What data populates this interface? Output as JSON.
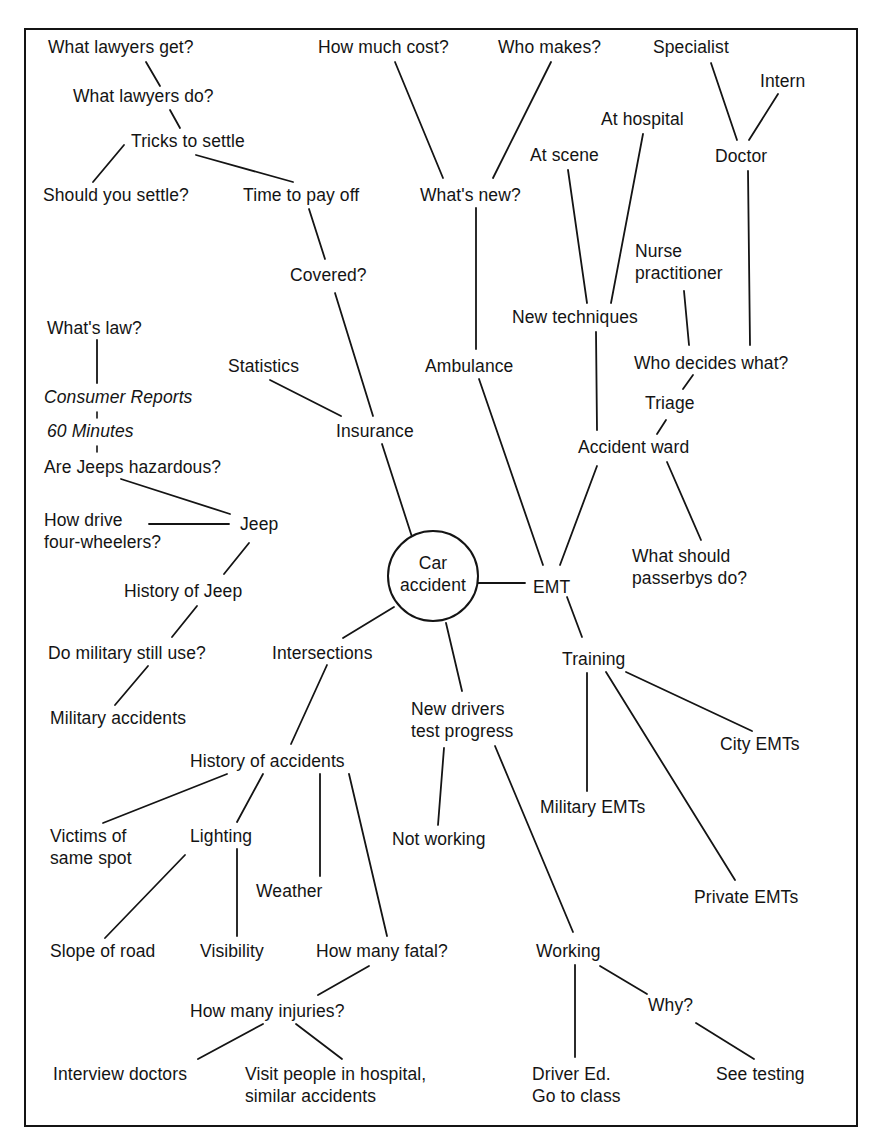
{
  "diagram": {
    "type": "mind-map",
    "center": {
      "id": "car-accident",
      "label": "Car\naccident",
      "x": 433,
      "y": 576,
      "r": 45
    },
    "border": {
      "x": 25,
      "y": 29,
      "w": 832,
      "h": 1097
    },
    "nodes": [
      {
        "id": "what-lawyers-get",
        "label": "What lawyers get?",
        "x": 48,
        "y": 36
      },
      {
        "id": "what-lawyers-do",
        "label": "What lawyers do?",
        "x": 73,
        "y": 85
      },
      {
        "id": "tricks-to-settle",
        "label": "Tricks to settle",
        "x": 131,
        "y": 130
      },
      {
        "id": "should-you-settle",
        "label": "Should you settle?",
        "x": 43,
        "y": 184
      },
      {
        "id": "time-to-pay-off",
        "label": "Time to pay off",
        "x": 243,
        "y": 184
      },
      {
        "id": "covered",
        "label": "Covered?",
        "x": 290,
        "y": 264
      },
      {
        "id": "how-much-cost",
        "label": "How much cost?",
        "x": 318,
        "y": 36
      },
      {
        "id": "who-makes",
        "label": "Who makes?",
        "x": 498,
        "y": 36
      },
      {
        "id": "whats-new",
        "label": "What's new?",
        "x": 420,
        "y": 184
      },
      {
        "id": "specialist",
        "label": "Specialist",
        "x": 653,
        "y": 36
      },
      {
        "id": "intern",
        "label": "Intern",
        "x": 760,
        "y": 70
      },
      {
        "id": "at-hospital",
        "label": "At hospital",
        "x": 601,
        "y": 108
      },
      {
        "id": "at-scene",
        "label": "At scene",
        "x": 530,
        "y": 144
      },
      {
        "id": "doctor",
        "label": "Doctor",
        "x": 715,
        "y": 145
      },
      {
        "id": "nurse-practitioner",
        "label": "Nurse\npractitioner",
        "x": 635,
        "y": 240
      },
      {
        "id": "new-techniques",
        "label": "New techniques",
        "x": 512,
        "y": 306
      },
      {
        "id": "whats-law",
        "label": "What's law?",
        "x": 47,
        "y": 317
      },
      {
        "id": "statistics",
        "label": "Statistics",
        "x": 228,
        "y": 355
      },
      {
        "id": "ambulance",
        "label": "Ambulance",
        "x": 425,
        "y": 355
      },
      {
        "id": "who-decides-what",
        "label": "Who decides what?",
        "x": 634,
        "y": 352
      },
      {
        "id": "consumer-reports",
        "label": "Consumer Reports",
        "x": 44,
        "y": 386,
        "italic": true
      },
      {
        "id": "triage",
        "label": "Triage",
        "x": 645,
        "y": 392
      },
      {
        "id": "insurance",
        "label": "Insurance",
        "x": 336,
        "y": 420
      },
      {
        "id": "sixty-minutes",
        "label": "60 Minutes",
        "x": 47,
        "y": 420,
        "italic": true
      },
      {
        "id": "accident-ward",
        "label": "Accident ward",
        "x": 578,
        "y": 436
      },
      {
        "id": "are-jeeps-hazardous",
        "label": "Are Jeeps hazardous?",
        "x": 44,
        "y": 456
      },
      {
        "id": "how-drive-four-wheelers",
        "label": "How drive\nfour-wheelers?",
        "x": 44,
        "y": 509
      },
      {
        "id": "jeep",
        "label": "Jeep",
        "x": 240,
        "y": 513
      },
      {
        "id": "what-should-passerbys-do",
        "label": "What should\npasserbys do?",
        "x": 632,
        "y": 545
      },
      {
        "id": "emt",
        "label": "EMT",
        "x": 533,
        "y": 576
      },
      {
        "id": "history-of-jeep",
        "label": "History of Jeep",
        "x": 124,
        "y": 580
      },
      {
        "id": "do-military-still-use",
        "label": "Do military still use?",
        "x": 48,
        "y": 642
      },
      {
        "id": "intersections",
        "label": "Intersections",
        "x": 272,
        "y": 642
      },
      {
        "id": "training",
        "label": "Training",
        "x": 562,
        "y": 648
      },
      {
        "id": "new-drivers-test-progress",
        "label": "New drivers\ntest progress",
        "x": 411,
        "y": 698
      },
      {
        "id": "military-accidents",
        "label": "Military accidents",
        "x": 50,
        "y": 707
      },
      {
        "id": "city-emts",
        "label": "City EMTs",
        "x": 720,
        "y": 733
      },
      {
        "id": "history-of-accidents",
        "label": "History of accidents",
        "x": 190,
        "y": 750
      },
      {
        "id": "victims-of-same-spot",
        "label": "Victims of\nsame spot",
        "x": 50,
        "y": 825
      },
      {
        "id": "lighting",
        "label": "Lighting",
        "x": 190,
        "y": 825
      },
      {
        "id": "military-emts",
        "label": "Military EMTs",
        "x": 540,
        "y": 796
      },
      {
        "id": "not-working",
        "label": "Not working",
        "x": 392,
        "y": 828
      },
      {
        "id": "weather",
        "label": "Weather",
        "x": 256,
        "y": 880
      },
      {
        "id": "private-emts",
        "label": "Private EMTs",
        "x": 694,
        "y": 886
      },
      {
        "id": "slope-of-road",
        "label": "Slope of road",
        "x": 50,
        "y": 940
      },
      {
        "id": "visibility",
        "label": "Visibility",
        "x": 200,
        "y": 940
      },
      {
        "id": "how-many-fatal",
        "label": "How many fatal?",
        "x": 316,
        "y": 940
      },
      {
        "id": "working",
        "label": "Working",
        "x": 536,
        "y": 940
      },
      {
        "id": "how-many-injuries",
        "label": "How many injuries?",
        "x": 190,
        "y": 1000
      },
      {
        "id": "why",
        "label": "Why?",
        "x": 648,
        "y": 994
      },
      {
        "id": "interview-doctors",
        "label": "Interview doctors",
        "x": 53,
        "y": 1063
      },
      {
        "id": "visit-people-in-hospital",
        "label": "Visit people in hospital,\nsimilar accidents",
        "x": 245,
        "y": 1063
      },
      {
        "id": "driver-ed",
        "label": "Driver Ed.\nGo to class",
        "x": 532,
        "y": 1063
      },
      {
        "id": "see-testing",
        "label": "See testing",
        "x": 716,
        "y": 1063
      }
    ],
    "edges": [
      {
        "from": "what-lawyers-get",
        "to": "what-lawyers-do",
        "x1": 146,
        "y1": 62,
        "x2": 160,
        "y2": 86
      },
      {
        "from": "what-lawyers-do",
        "to": "tricks-to-settle",
        "x1": 170,
        "y1": 110,
        "x2": 180,
        "y2": 128
      },
      {
        "from": "tricks-to-settle",
        "to": "should-you-settle",
        "x1": 124,
        "y1": 145,
        "x2": 93,
        "y2": 182
      },
      {
        "from": "tricks-to-settle",
        "to": "time-to-pay-off",
        "x1": 196,
        "y1": 155,
        "x2": 293,
        "y2": 182
      },
      {
        "from": "time-to-pay-off",
        "to": "covered",
        "x1": 309,
        "y1": 209,
        "x2": 325,
        "y2": 259
      },
      {
        "from": "covered",
        "to": "insurance",
        "x1": 335,
        "y1": 293,
        "x2": 373,
        "y2": 416
      },
      {
        "from": "insurance",
        "to": "statistics",
        "x1": 341,
        "y1": 416,
        "x2": 270,
        "y2": 380
      },
      {
        "from": "insurance",
        "to": "car-accident",
        "x1": 382,
        "y1": 444,
        "x2": 413,
        "y2": 540
      },
      {
        "from": "how-much-cost",
        "to": "whats-new",
        "x1": 395,
        "y1": 62,
        "x2": 443,
        "y2": 178
      },
      {
        "from": "who-makes",
        "to": "whats-new",
        "x1": 551,
        "y1": 62,
        "x2": 493,
        "y2": 178
      },
      {
        "from": "whats-new",
        "to": "ambulance",
        "x1": 476,
        "y1": 208,
        "x2": 476,
        "y2": 349
      },
      {
        "from": "ambulance",
        "to": "emt",
        "x1": 479,
        "y1": 379,
        "x2": 543,
        "y2": 565
      },
      {
        "from": "at-scene",
        "to": "new-techniques",
        "x1": 568,
        "y1": 170,
        "x2": 587,
        "y2": 303
      },
      {
        "from": "at-hospital",
        "to": "new-techniques",
        "x1": 643,
        "y1": 134,
        "x2": 611,
        "y2": 303
      },
      {
        "from": "new-techniques",
        "to": "accident-ward",
        "x1": 596,
        "y1": 332,
        "x2": 597,
        "y2": 430
      },
      {
        "from": "specialist",
        "to": "doctor",
        "x1": 711,
        "y1": 63,
        "x2": 737,
        "y2": 140
      },
      {
        "from": "intern",
        "to": "doctor",
        "x1": 778,
        "y1": 94,
        "x2": 749,
        "y2": 140
      },
      {
        "from": "doctor",
        "to": "who-decides-what",
        "x1": 748,
        "y1": 171,
        "x2": 750,
        "y2": 345
      },
      {
        "from": "nurse-practitioner",
        "to": "who-decides-what",
        "x1": 684,
        "y1": 291,
        "x2": 689,
        "y2": 345
      },
      {
        "from": "who-decides-what",
        "to": "triage",
        "x1": 693,
        "y1": 375,
        "x2": 683,
        "y2": 389
      },
      {
        "from": "triage",
        "to": "accident-ward",
        "x1": 666,
        "y1": 420,
        "x2": 657,
        "y2": 434
      },
      {
        "from": "accident-ward",
        "to": "emt",
        "x1": 597,
        "y1": 466,
        "x2": 560,
        "y2": 565
      },
      {
        "from": "accident-ward",
        "to": "what-should-passerbys-do",
        "x1": 667,
        "y1": 462,
        "x2": 701,
        "y2": 540
      },
      {
        "from": "car-accident",
        "to": "emt",
        "x1": 478,
        "y1": 583,
        "x2": 525,
        "y2": 583
      },
      {
        "from": "whats-law",
        "to": "consumer-reports",
        "x1": 97,
        "y1": 340,
        "x2": 97,
        "y2": 383
      },
      {
        "from": "consumer-reports",
        "to": "sixty-minutes",
        "x1": 97,
        "y1": 412,
        "x2": 97,
        "y2": 418,
        "style": "tick"
      },
      {
        "from": "sixty-minutes",
        "to": "are-jeeps-hazardous",
        "x1": 97,
        "y1": 446,
        "x2": 97,
        "y2": 452,
        "style": "tick"
      },
      {
        "from": "are-jeeps-hazardous",
        "to": "jeep",
        "x1": 121,
        "y1": 479,
        "x2": 230,
        "y2": 514
      },
      {
        "from": "how-drive-four-wheelers",
        "to": "jeep",
        "x1": 149,
        "y1": 524,
        "x2": 229,
        "y2": 524
      },
      {
        "from": "jeep",
        "to": "history-of-jeep",
        "x1": 249,
        "y1": 543,
        "x2": 224,
        "y2": 574
      },
      {
        "from": "history-of-jeep",
        "to": "do-military-still-use",
        "x1": 197,
        "y1": 606,
        "x2": 172,
        "y2": 637
      },
      {
        "from": "do-military-still-use",
        "to": "military-accidents",
        "x1": 148,
        "y1": 666,
        "x2": 115,
        "y2": 705
      },
      {
        "from": "car-accident",
        "to": "intersections",
        "x1": 394,
        "y1": 607,
        "x2": 343,
        "y2": 638
      },
      {
        "from": "intersections",
        "to": "history-of-accidents",
        "x1": 327,
        "y1": 665,
        "x2": 291,
        "y2": 744
      },
      {
        "from": "car-accident",
        "to": "new-drivers-test-progress",
        "x1": 446,
        "y1": 623,
        "x2": 462,
        "y2": 691
      },
      {
        "from": "emt",
        "to": "training",
        "x1": 567,
        "y1": 597,
        "x2": 582,
        "y2": 637
      },
      {
        "from": "training",
        "to": "military-emts",
        "x1": 587,
        "y1": 673,
        "x2": 587,
        "y2": 791
      },
      {
        "from": "training",
        "to": "private-emts",
        "x1": 606,
        "y1": 672,
        "x2": 735,
        "y2": 880
      },
      {
        "from": "training",
        "to": "city-emts",
        "x1": 626,
        "y1": 672,
        "x2": 752,
        "y2": 731
      },
      {
        "from": "history-of-accidents",
        "to": "victims-of-same-spot",
        "x1": 227,
        "y1": 774,
        "x2": 103,
        "y2": 823
      },
      {
        "from": "history-of-accidents",
        "to": "lighting",
        "x1": 263,
        "y1": 774,
        "x2": 237,
        "y2": 822
      },
      {
        "from": "history-of-accidents",
        "to": "weather",
        "x1": 320,
        "y1": 774,
        "x2": 320,
        "y2": 876
      },
      {
        "from": "history-of-accidents",
        "to": "how-many-fatal",
        "x1": 349,
        "y1": 774,
        "x2": 387,
        "y2": 936
      },
      {
        "from": "lighting",
        "to": "slope-of-road",
        "x1": 185,
        "y1": 855,
        "x2": 105,
        "y2": 938
      },
      {
        "from": "lighting",
        "to": "visibility",
        "x1": 237,
        "y1": 849,
        "x2": 237,
        "y2": 936
      },
      {
        "from": "how-many-fatal",
        "to": "how-many-injuries",
        "x1": 369,
        "y1": 966,
        "x2": 318,
        "y2": 995
      },
      {
        "from": "how-many-injuries",
        "to": "interview-doctors",
        "x1": 263,
        "y1": 1024,
        "x2": 198,
        "y2": 1059
      },
      {
        "from": "how-many-injuries",
        "to": "visit-people-in-hospital",
        "x1": 296,
        "y1": 1024,
        "x2": 342,
        "y2": 1059
      },
      {
        "from": "new-drivers-test-progress",
        "to": "not-working",
        "x1": 444,
        "y1": 748,
        "x2": 438,
        "y2": 825
      },
      {
        "from": "new-drivers-test-progress",
        "to": "working",
        "x1": 495,
        "y1": 746,
        "x2": 573,
        "y2": 932
      },
      {
        "from": "working",
        "to": "driver-ed",
        "x1": 575,
        "y1": 965,
        "x2": 575,
        "y2": 1057
      },
      {
        "from": "working",
        "to": "why",
        "x1": 600,
        "y1": 966,
        "x2": 647,
        "y2": 994
      },
      {
        "from": "why",
        "to": "see-testing",
        "x1": 696,
        "y1": 1023,
        "x2": 754,
        "y2": 1059
      }
    ]
  },
  "colors": {
    "ink": "#141414",
    "background": "#ffffff"
  }
}
